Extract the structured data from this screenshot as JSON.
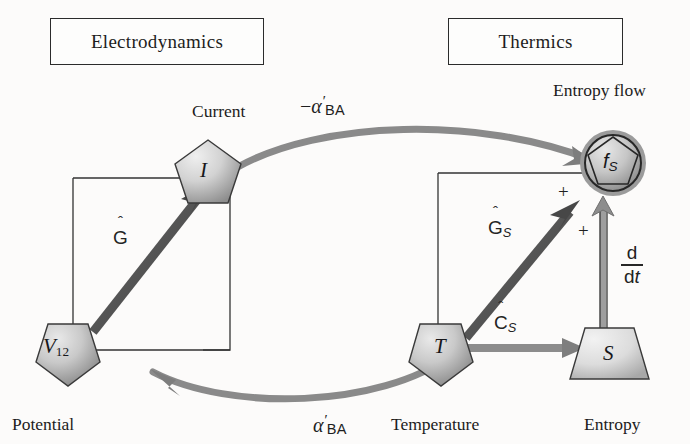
{
  "figure": {
    "type": "block-diagram",
    "domain_headers": [
      {
        "id": "electrodynamics",
        "label": "Electrodynamics"
      },
      {
        "id": "thermics",
        "label": "Thermics"
      }
    ],
    "nodes": [
      {
        "id": "current",
        "symbol": "I",
        "symbol_sub": "",
        "caption": "Current",
        "shape": "pentagon-up"
      },
      {
        "id": "potential",
        "symbol": "V",
        "symbol_sub": "12",
        "caption": "Potential",
        "shape": "pentagon-down"
      },
      {
        "id": "entropy_flow",
        "symbol": "f",
        "symbol_sub": "S",
        "caption": "Entropy flow",
        "shape": "circle-pentagon"
      },
      {
        "id": "temperature",
        "symbol": "T",
        "symbol_sub": "",
        "caption": "Temperature",
        "shape": "pentagon-down"
      },
      {
        "id": "entropy",
        "symbol": "S",
        "symbol_sub": "",
        "caption": "Entropy",
        "shape": "trapezoid"
      }
    ],
    "edges": [
      {
        "id": "g-hat",
        "label": "G",
        "hat": true,
        "sub": "",
        "from": "potential",
        "to": "current",
        "style": "thick-solid"
      },
      {
        "id": "gs-hat",
        "label": "G",
        "hat": true,
        "sub": "S",
        "from": "temperature",
        "to": "entropy_flow",
        "style": "thick-solid"
      },
      {
        "id": "cs-hat",
        "label": "C",
        "hat": true,
        "sub": "S",
        "from": "temperature",
        "to": "entropy",
        "style": "thick-gray"
      },
      {
        "id": "alpha-top",
        "label": "−α′BA",
        "from": "current",
        "to": "entropy_flow",
        "style": "curved-gray"
      },
      {
        "id": "alpha-bottom",
        "label": "α′BA",
        "from": "temperature",
        "to": "potential",
        "style": "curved-gray"
      },
      {
        "id": "ddt",
        "label": "d/dt",
        "from": "entropy",
        "to": "entropy_flow",
        "style": "double-line"
      }
    ],
    "edge_labels": {
      "alpha_top_minus": "−",
      "alpha_symbol": "α",
      "alpha_prime": "′",
      "alpha_sub": "BA",
      "hat_mark": "ˆ",
      "ddt_numerator": "d",
      "ddt_denominator_d": "d",
      "ddt_denominator_t": "t"
    },
    "sign_markers": [
      {
        "id": "plus-top",
        "label": "+"
      },
      {
        "id": "plus-bottom",
        "label": "+"
      }
    ],
    "colors": {
      "ink": "#1d1d1d",
      "node_fill_light": "#e2e2e2",
      "node_fill_dark": "#8e8e8e",
      "thick_arrow": "#555555",
      "gray_arrow": "#8a8a8a",
      "halo": "#9b9b9b",
      "background": "#fcfbfa"
    }
  }
}
